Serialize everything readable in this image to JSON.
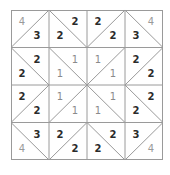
{
  "puzzle": {
    "rows": 4,
    "cols": 4,
    "colors": {
      "grid": "#9a9a9a",
      "text": "#2b2b2b",
      "corner_text": "#9a9a9a"
    },
    "cells": [
      [
        {
          "diag": "/",
          "a": "4",
          "b": "3"
        },
        {
          "diag": "\\",
          "a": "2",
          "b": "2"
        },
        {
          "diag": "/",
          "a": "2",
          "b": "2"
        },
        {
          "diag": "\\",
          "a": "4",
          "b": "3"
        }
      ],
      [
        {
          "diag": "\\",
          "a": "2",
          "b": "2"
        },
        {
          "diag": "\\",
          "a": "1",
          "b": "1"
        },
        {
          "diag": "/",
          "a": "1",
          "b": "1"
        },
        {
          "diag": "/",
          "a": "2",
          "b": "2"
        }
      ],
      [
        {
          "diag": "/",
          "a": "2",
          "b": "2"
        },
        {
          "diag": "/",
          "a": "1",
          "b": "1"
        },
        {
          "diag": "\\",
          "a": "1",
          "b": "1"
        },
        {
          "diag": "\\",
          "a": "2",
          "b": "2"
        }
      ],
      [
        {
          "diag": "\\",
          "a": "3",
          "b": "4"
        },
        {
          "diag": "/",
          "a": "2",
          "b": "2"
        },
        {
          "diag": "\\",
          "a": "2",
          "b": "2"
        },
        {
          "diag": "/",
          "a": "3",
          "b": "4"
        }
      ]
    ]
  }
}
